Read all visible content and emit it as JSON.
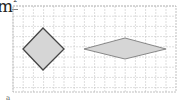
{
  "label": {
    "unit": "m",
    "exponent": "2"
  },
  "footer_mark": "a",
  "grid": {
    "x0": 13,
    "y0": 6,
    "x1": 176,
    "y1": 92,
    "cell": 10.2,
    "line_color": "#c8c8c8",
    "border_color": "#b0b0b0"
  },
  "shapes": [
    {
      "name": "square-rhombus",
      "points": "43,28 64,49 43,70 23,49",
      "fill": "#d6d6d6",
      "stroke": "#444444",
      "stroke_width": 1.3
    },
    {
      "name": "flat-rhombus",
      "points": "84,49 125,38 166,49 125,59",
      "fill": "#d6d6d6",
      "stroke": "#888888",
      "stroke_width": 1
    }
  ]
}
